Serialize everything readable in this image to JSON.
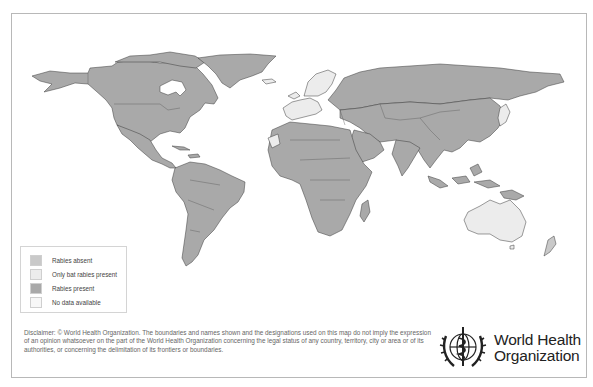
{
  "map": {
    "title": "Rabies presence worldwide",
    "colors": {
      "rabies_absent": "#c9c9c9",
      "only_bat_rabies_present": "#ececec",
      "rabies_present": "#a9a9a9",
      "no_data_available": "#f7f7f7",
      "borders": "#333333",
      "water": "#ffffff"
    }
  },
  "legend": {
    "items": [
      {
        "label": "Rabies absent",
        "color": "#c9c9c9"
      },
      {
        "label": "Only bat rabies present",
        "color": "#ececec"
      },
      {
        "label": "Rabies present",
        "color": "#a9a9a9"
      },
      {
        "label": "No data available",
        "color": "#f7f7f7"
      }
    ]
  },
  "disclaimer": {
    "text": "Disclaimer: © World Health Organization. The boundaries and names shown and the designations used on this map do not imply the expression of an opinion whatsoever on the part of the World Health Organization concerning the legal status of any country, territory, city or area or of its authorities, or concerning the delimitation of its frontiers or boundaries."
  },
  "logo": {
    "line1": "World Health",
    "line2": "Organization",
    "icon": "who-emblem-icon"
  }
}
